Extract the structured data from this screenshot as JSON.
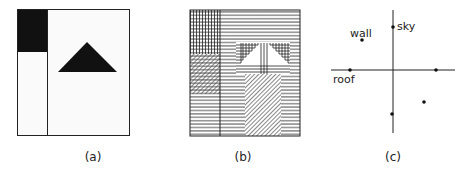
{
  "panels": [
    {
      "id": "a",
      "caption": "(a)",
      "description": "segmented image with dark region and triangle"
    },
    {
      "id": "b",
      "caption": "(b)",
      "description": "texture-hatched regions"
    },
    {
      "id": "c",
      "caption": "(c)",
      "description": "feature-space scatter plot",
      "labels": {
        "sky": "sky",
        "wall": "wall",
        "roof": "roof"
      }
    }
  ],
  "colors": {
    "ink": "#111111",
    "paper": "#ffffff",
    "light_fill": "#f7f7f7"
  }
}
